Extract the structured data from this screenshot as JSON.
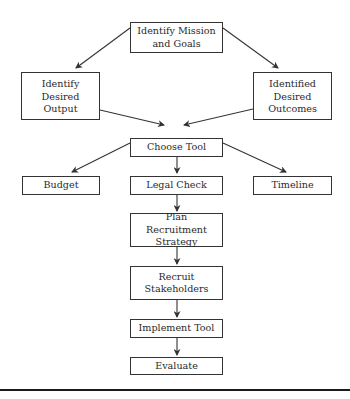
{
  "diagram": {
    "type": "flowchart",
    "nodes": [
      {
        "id": "mission",
        "label": "Identify Mission\nand Goals"
      },
      {
        "id": "output",
        "label": "Identify Desired\nOutput"
      },
      {
        "id": "outcomes",
        "label": "Identified\nDesired\nOutcomes"
      },
      {
        "id": "choose",
        "label": "Choose Tool"
      },
      {
        "id": "budget",
        "label": "Budget"
      },
      {
        "id": "legal",
        "label": "Legal Check"
      },
      {
        "id": "timeline",
        "label": "Timeline"
      },
      {
        "id": "plan",
        "label": "Plan Recruitment\nStrategy"
      },
      {
        "id": "recruit",
        "label": "Recruit\nStakeholders"
      },
      {
        "id": "implement",
        "label": "Implement Tool"
      },
      {
        "id": "evaluate",
        "label": "Evaluate"
      }
    ],
    "edges": [
      {
        "from": "mission",
        "to": "output"
      },
      {
        "from": "mission",
        "to": "outcomes"
      },
      {
        "from": "output",
        "to": "choose"
      },
      {
        "from": "outcomes",
        "to": "choose"
      },
      {
        "from": "choose",
        "to": "budget"
      },
      {
        "from": "choose",
        "to": "legal"
      },
      {
        "from": "choose",
        "to": "timeline"
      },
      {
        "from": "legal",
        "to": "plan"
      },
      {
        "from": "plan",
        "to": "recruit"
      },
      {
        "from": "recruit",
        "to": "implement"
      },
      {
        "from": "implement",
        "to": "evaluate"
      }
    ],
    "colors": {
      "stroke": "#333333",
      "text": "#2a2a2a",
      "background": "#ffffff"
    }
  }
}
